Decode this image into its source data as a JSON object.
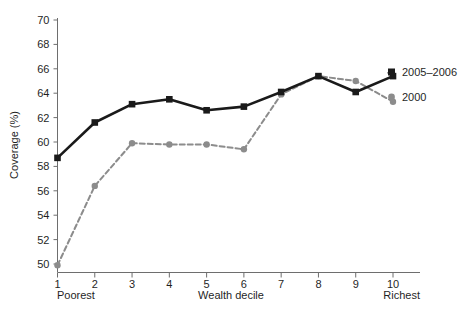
{
  "chart_data": {
    "type": "line",
    "title": "",
    "xlabel": "Wealth decile",
    "ylabel": "Coverage (%)",
    "x": [
      1,
      2,
      3,
      4,
      5,
      6,
      7,
      8,
      9,
      10
    ],
    "xticklabels": [
      "1",
      "2",
      "3",
      "4",
      "5",
      "6",
      "7",
      "8",
      "9",
      "10"
    ],
    "xlim": [
      1,
      10
    ],
    "x_end_labels": {
      "left": "Poorest",
      "right": "Richest"
    },
    "ylim": [
      50,
      70
    ],
    "yticks": [
      50,
      52,
      54,
      56,
      58,
      60,
      62,
      64,
      66,
      68,
      70
    ],
    "yticklabels": [
      "50",
      "52",
      "54",
      "56",
      "58",
      "60",
      "62",
      "64",
      "66",
      "68",
      "70"
    ],
    "grid": false,
    "legend_position": "right-inside-plot-edge",
    "series": [
      {
        "name": "2005–2006",
        "marker": "square",
        "linestyle": "solid",
        "color": "#1a1a1a",
        "values": [
          58.7,
          61.6,
          63.1,
          63.5,
          62.6,
          62.9,
          64.1,
          65.4,
          64.1,
          65.4
        ]
      },
      {
        "name": "2000",
        "marker": "circle",
        "linestyle": "dashed",
        "color": "#8c8c8c",
        "values": [
          49.9,
          56.4,
          59.9,
          59.8,
          59.8,
          59.4,
          63.9,
          65.4,
          65.0,
          63.3
        ]
      }
    ]
  },
  "legend": {
    "entries": [
      {
        "label": "2005–2006",
        "marker": "square",
        "color": "#1a1a1a"
      },
      {
        "label": "2000",
        "marker": "circle",
        "color": "#8c8c8c"
      }
    ]
  },
  "colors": {
    "series_2005_2006": "#1a1a1a",
    "series_2000": "#8c8c8c",
    "axis": "#6e6e6e",
    "background": "#ffffff",
    "text": "#1f1f1f"
  }
}
